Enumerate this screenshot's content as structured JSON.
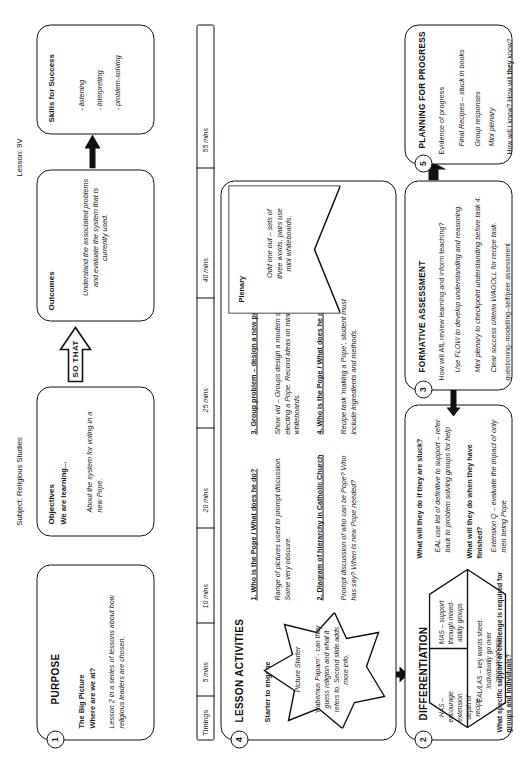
{
  "header": {
    "subject": "Subject:  Religious Studies",
    "lesson": "Lesson: 9V"
  },
  "purpose": {
    "number": "1",
    "title": "PURPOSE",
    "heading": "The Big Picture",
    "question": "Where are we at?",
    "body": "Lesson 2 in a series of lessons about how religious leaders are chosen."
  },
  "objectives": {
    "title": "Objectives",
    "heading": "We are learning...",
    "body": "About the system for voting in a new Pope."
  },
  "connector": {
    "so_that": "SO THAT"
  },
  "outcomes": {
    "title": "Outcomes",
    "body": "Understand the associated problems and evaluate the system that is currently used."
  },
  "skills": {
    "title": "Skills for Success",
    "items": [
      "- listening",
      "- interpreting",
      "- problem-solving"
    ]
  },
  "timings": {
    "label": "Timings",
    "marks": [
      "5 mins",
      "10 mins",
      "20 mins",
      "25 mins",
      "40 mins",
      "55 mins"
    ]
  },
  "activities": {
    "number": "4",
    "title": "LESSON ACTIVITIES",
    "starter_label": "Starter to engage",
    "starter_title": "Picture Starter",
    "starter_body": "'Habemus Papam' - can they guess religion and what it refers to. Second slide adds more info.",
    "steps": [
      {
        "heading": "1. Who is the Pope / What does he do?",
        "body": "Range of pictures used to prompt discussion. Some very obscure."
      },
      {
        "heading": "2. Diagram of hierarchy in Catholic Church",
        "body": "Prompt discussion of who can be Pope? Who has say? When is new Pope needed?"
      },
      {
        "heading": "3. Group problem – design a new process",
        "body": "Show vid – Groups design a modern system for electing a Pope. Record ideas on mini whiteboards."
      },
      {
        "heading": "4. Who is the Pope / What does he do?",
        "body": "Recipe task 'making a Pope', student must include ingredients and methods."
      }
    ],
    "plenary_label": "Plenary",
    "plenary_body": "Odd one out – sets of three words, pairs use mini whiteboards."
  },
  "differentiation": {
    "number": "2",
    "title": "DIFFERENTIATION",
    "hex": [
      "HAS – encourage extension depth of recipe",
      "MAS – support through mixed-ability groups",
      "EAL/LAS – key words sheet. Individually go over pronunciations"
    ],
    "footer": "What specific support or challenge is required for groups and individuals?",
    "q1": "What will they do if they are stuck?",
    "a1": "EAL use list of definitive to support – refer back to problem solving groups for help",
    "q2": "What will they do when they have finished?",
    "a2": "Extension Q – evaluate the impact of only men being Pope"
  },
  "formative": {
    "number": "3",
    "title": "FORMATIVE ASSESSMENT",
    "question": "How will AfL review learning and inform teaching?",
    "items": [
      "Use FLOW to develop understanding and reasoning.",
      "Mini plenary to checkpoint understanding before task 4.",
      "Clear success criteria WAGOLL for recipe task."
    ],
    "footer": "questioning–modelling–self/peer assessment"
  },
  "planning": {
    "number": "5",
    "title": "PLANNING FOR PROGRESS",
    "heading": "Evidence of progress",
    "items": [
      "Final Recipes – stuck in books",
      "Group responses",
      "Mini plenary"
    ],
    "footer_a": "How will I know? How will ",
    "footer_b": "they",
    "footer_c": " know?"
  }
}
